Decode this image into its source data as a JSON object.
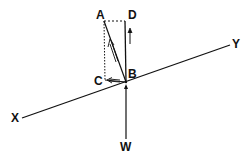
{
  "diagram": {
    "type": "force-resolution-on-inclined-plane",
    "stroke_color": "#111111",
    "background": "#ffffff",
    "labels": {
      "A": "A",
      "B": "B",
      "C": "C",
      "D": "D",
      "X": "X",
      "Y": "Y",
      "W": "W"
    },
    "points": {
      "A": [
        104,
        21
      ],
      "B": [
        126,
        82
      ],
      "C": [
        105,
        80
      ],
      "D": [
        125,
        21
      ],
      "X_end": [
        22,
        118
      ],
      "Y_end": [
        230,
        45
      ],
      "W_tail": [
        126,
        138
      ]
    }
  }
}
